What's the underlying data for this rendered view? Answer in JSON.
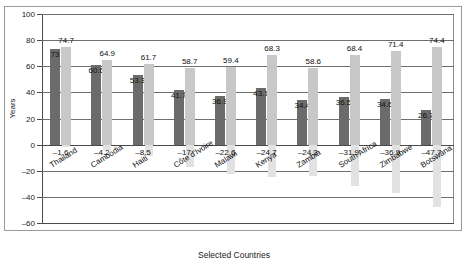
{
  "chart_data": {
    "type": "bar",
    "title": "",
    "xlabel": "Selected Countries",
    "ylabel": "Years",
    "ylim": [
      -60,
      100
    ],
    "ytick_labels": [
      "100",
      "80",
      "60",
      "40",
      "20",
      "0",
      "–20",
      "–40",
      "–60"
    ],
    "ytick_values": [
      100,
      80,
      60,
      40,
      20,
      0,
      -20,
      -40,
      -60
    ],
    "grid": true,
    "legend": "none",
    "categories": [
      "Thailand",
      "Cambodia",
      "Haiti",
      "Côte d'Ivoire",
      "Malawi",
      "Kenya",
      "Zambia",
      "South Africa",
      "Zimbabwe",
      "Botswana"
    ],
    "series": [
      {
        "name": "series-a",
        "color": "#6b6b6b",
        "values": [
          73,
          60.6,
          53.3,
          41.7,
          36.9,
          43.7,
          34.4,
          36.5,
          34.6,
          26.7
        ],
        "labels": [
          "73",
          "60.6",
          "53.3",
          "41.7",
          "36.9",
          "43.7",
          "34.4",
          "36.5",
          "34.6",
          "26.7"
        ]
      },
      {
        "name": "series-b",
        "color": "#c8c8c8",
        "values": [
          74.7,
          64.9,
          61.7,
          58.7,
          59.4,
          68.3,
          58.6,
          68.4,
          71.4,
          74.4
        ],
        "labels": [
          "74.7",
          "64.9",
          "61.7",
          "58.7",
          "59.4",
          "68.3",
          "58.6",
          "68.4",
          "71.4",
          "74.4"
        ]
      },
      {
        "name": "series-c",
        "color": "#e2e2e2",
        "values": [
          -1.6,
          -4.2,
          -8.5,
          -17,
          -22.6,
          -24.7,
          -24.3,
          -31.9,
          -36.9,
          -47.7
        ],
        "labels": [
          "–1.6",
          "–4.2",
          "–8.5",
          "–17",
          "–22.6",
          "–24.7",
          "–24.3",
          "–31.9",
          "–36.9",
          "–47.7"
        ]
      }
    ]
  }
}
